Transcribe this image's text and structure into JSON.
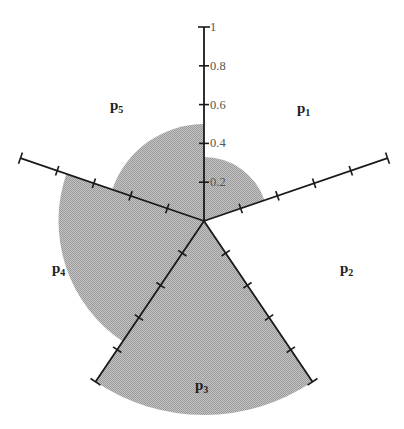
{
  "chart_data": {
    "type": "polar-area",
    "title": "",
    "categories": [
      "p1",
      "p2",
      "p3",
      "p4",
      "p5"
    ],
    "values": [
      0.33,
      0.0,
      1.0,
      0.75,
      0.5
    ],
    "values_note": "Estimated from pixel geometry; not read from labeled data.",
    "radial_axis": {
      "range": [
        0,
        1
      ],
      "ticks": [
        0.2,
        0.4,
        0.6,
        0.8,
        1
      ],
      "tick_labels": [
        "0.2",
        "0.4",
        "0.6",
        "0.8",
        "1"
      ]
    },
    "axes_angles_deg": [
      -90,
      -18.9,
      56,
      124,
      198.9
    ],
    "sector_bounds_deg": [
      [
        -90,
        -18.9
      ],
      [
        -18.9,
        56
      ],
      [
        56,
        124
      ],
      [
        124,
        198.9
      ],
      [
        198.9,
        270
      ]
    ],
    "label_positions": [
      {
        "name": "p1",
        "x": 297,
        "y": 113
      },
      {
        "name": "p2",
        "x": 340,
        "y": 273
      },
      {
        "name": "p3",
        "x": 195,
        "y": 390
      },
      {
        "name": "p4",
        "x": 52,
        "y": 273
      },
      {
        "name": "p5",
        "x": 110,
        "y": 110
      }
    ],
    "center": {
      "x": 204,
      "y": 221
    },
    "radius_px": 194,
    "grid": false,
    "legend": "none",
    "fill_color": "#b5b5b5",
    "axis_color": "#1a1a1a"
  }
}
